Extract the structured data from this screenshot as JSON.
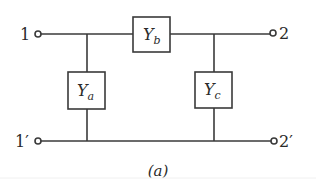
{
  "diagram": {
    "type": "pi-network two-port",
    "caption": "(a)",
    "terminals": {
      "t1": "1",
      "t1p": "1′",
      "t2": "2",
      "t2p": "2′"
    },
    "elements": {
      "ya": {
        "symbol": "Y",
        "subscript": "a"
      },
      "yb": {
        "symbol": "Y",
        "subscript": "b"
      },
      "yc": {
        "symbol": "Y",
        "subscript": "c"
      }
    },
    "colors": {
      "line": "#3a3a3a",
      "background": "#ffffff"
    }
  }
}
